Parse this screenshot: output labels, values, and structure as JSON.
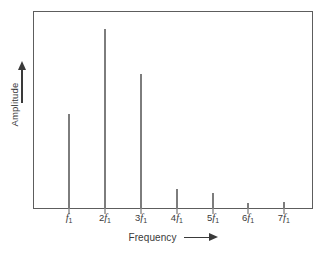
{
  "chart_data": {
    "type": "bar",
    "title": "",
    "subtitle": "",
    "xlabel": "Frequency",
    "ylabel": "Amplitude",
    "xlabel_arrow": "arrow-right",
    "ylabel_arrow": "arrow-up",
    "grid": false,
    "legend": "none",
    "axis_ticks_y": [],
    "ylim": [
      0,
      100
    ],
    "categories": [
      "f₁",
      "2f₁",
      "3f₁",
      "4f₁",
      "5f₁",
      "6f₁",
      "7f₁"
    ],
    "tick_labels": [
      {
        "coefficient": "",
        "symbol": "f",
        "subscript": "1"
      },
      {
        "coefficient": "2",
        "symbol": "f",
        "subscript": "1"
      },
      {
        "coefficient": "3",
        "symbol": "f",
        "subscript": "1"
      },
      {
        "coefficient": "4",
        "symbol": "f",
        "subscript": "1"
      },
      {
        "coefficient": "5",
        "symbol": "f",
        "subscript": "1"
      },
      {
        "coefficient": "6",
        "symbol": "f",
        "subscript": "1"
      },
      {
        "coefficient": "7",
        "symbol": "f",
        "subscript": "1"
      }
    ],
    "values": [
      48,
      91,
      68,
      10,
      8,
      3,
      3.5
    ],
    "bar_x_percent": [
      12.9,
      25.7,
      38.6,
      51.4,
      64.3,
      76.8,
      89.6
    ],
    "colors": {
      "bar": "#7d7d7d",
      "frame": "#5d5d5d",
      "text": "#3a3a3a",
      "background": "#ffffff"
    }
  }
}
